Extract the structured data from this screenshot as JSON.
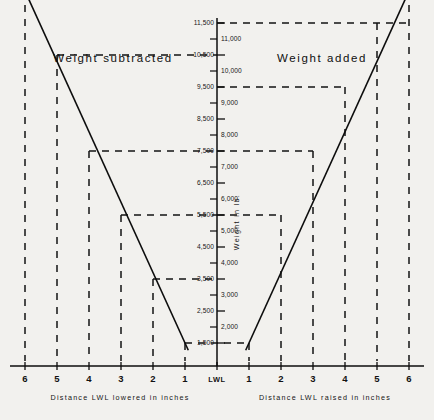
{
  "figure": {
    "region_left_label": "Weight subtracted",
    "region_right_label": "Weight added",
    "xaxis_left_caption": "Distance LWL lowered in inches",
    "xaxis_right_caption": "Distance LWL raised in inches",
    "yaxis_caption": "Weight in lb.",
    "center_tick_label": "LWL"
  },
  "chart_data": {
    "type": "line",
    "title": "",
    "subtitle": "",
    "xlabel_left": "Distance LWL lowered in inches",
    "xlabel_right": "Distance LWL raised in inches",
    "ylabel": "Weight in lb.",
    "grid": false,
    "legend": "none",
    "x_center_label": "LWL",
    "x_tick_labels_left": [
      "6",
      "5",
      "4",
      "3",
      "2",
      "1"
    ],
    "x_tick_labels_right": [
      "1",
      "2",
      "3",
      "4",
      "5",
      "6"
    ],
    "x_inches": [
      -6,
      -5,
      -4,
      -3,
      -2,
      -1,
      0,
      1,
      2,
      3,
      4,
      5,
      6
    ],
    "ylim": [
      1500,
      11500
    ],
    "y_tick_step": 500,
    "y_tick_labels_left": [
      "11,500",
      "10,500",
      "9,500",
      "8,500",
      "7,500",
      "6,500",
      "5,500",
      "4,500",
      "3,500",
      "2,500",
      "1,500"
    ],
    "y_tick_labels_right": [
      "11,000",
      "10,000",
      "9,000",
      "8,000",
      "7,000",
      "6,000",
      "5,000",
      "4,000",
      "3,000",
      "2,000"
    ],
    "y_tick_values_left": [
      11500,
      10500,
      9500,
      8500,
      7500,
      6500,
      5500,
      4500,
      3500,
      2500,
      1500
    ],
    "y_tick_values_right": [
      11000,
      10000,
      9000,
      8000,
      7000,
      6000,
      5000,
      4000,
      3000,
      2000
    ],
    "series": [
      {
        "name": "Weight subtracted",
        "side": "left",
        "x": [
          -6,
          -5,
          -4,
          -3,
          -2,
          -1
        ],
        "values": [
          12500,
          10500,
          7500,
          5500,
          3500,
          1500
        ]
      },
      {
        "name": "Weight added",
        "side": "right",
        "x": [
          1,
          2,
          3,
          4,
          5,
          6
        ],
        "values": [
          1500,
          5500,
          7500,
          9500,
          11500,
          12500
        ]
      }
    ],
    "guide_lines": [
      {
        "y": 10500,
        "from_x": -5,
        "to_x": 0
      },
      {
        "y": 7500,
        "from_x": -4,
        "to_x": 0
      },
      {
        "y": 5500,
        "from_x": -3,
        "to_x": 0
      },
      {
        "y": 3500,
        "from_x": -2,
        "to_x": 0
      },
      {
        "y": 1500,
        "from_x": -1,
        "to_x": 1
      },
      {
        "y": 5500,
        "from_x": 0,
        "to_x": 2
      },
      {
        "y": 7500,
        "from_x": 0,
        "to_x": 3
      },
      {
        "y": 9500,
        "from_x": 0,
        "to_x": 4
      },
      {
        "y": 11500,
        "from_x": 0,
        "to_x": 6
      }
    ],
    "vertical_guides_x": [
      -6,
      -5,
      -4,
      -3,
      -2,
      -1,
      1,
      2,
      3,
      4,
      5,
      6
    ]
  }
}
